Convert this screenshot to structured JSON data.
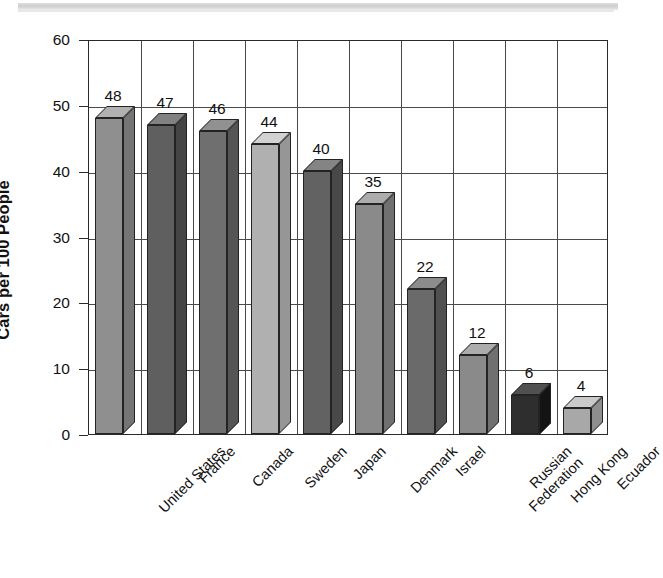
{
  "chart_data": {
    "type": "bar",
    "title": "",
    "subtitle": "",
    "xlabel": "",
    "ylabel": "Cars per 100 People",
    "ylim": [
      0,
      60
    ],
    "ytick_step": 10,
    "yticks": [
      "0",
      "10",
      "20",
      "30",
      "40",
      "50",
      "60"
    ],
    "grid": true,
    "legend": null,
    "style": "3d-bar",
    "categories": [
      "United States",
      "France",
      "Canada",
      "Sweden",
      "Japan",
      "Denmark",
      "Israel",
      "Russian\nFederation",
      "Hong Kong",
      "Ecuador"
    ],
    "values": [
      48,
      47,
      46,
      44,
      40,
      35,
      22,
      12,
      6,
      4
    ],
    "value_labels": [
      "48",
      "47",
      "46",
      "44",
      "40",
      "35",
      "22",
      "12",
      "6",
      "4"
    ],
    "bar_colors": [
      "#8f8f8f",
      "#5f5f5f",
      "#6f6f6f",
      "#b0b0b0",
      "#626262",
      "#8a8a8a",
      "#6a6a6a",
      "#8a8a8a",
      "#2e2e2e",
      "#a8a8a8"
    ]
  },
  "colors": {
    "axis": "#2a2a2a",
    "grid": "#4a4a4a",
    "text": "#111111",
    "background": "#ffffff"
  }
}
